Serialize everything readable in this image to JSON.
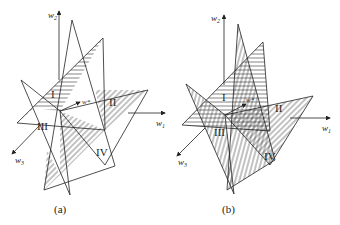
{
  "figure": {
    "panels": [
      {
        "id": "a",
        "caption": "(a)",
        "axes": {
          "x": "w",
          "x_sub": "1",
          "y": "w",
          "y_sub": "2",
          "z": "w",
          "z_sub": "3"
        },
        "vector_label": "w*",
        "regions": [
          "I",
          "II",
          "III",
          "IV"
        ]
      },
      {
        "id": "b",
        "caption": "(b)",
        "axes": {
          "x": "w",
          "x_sub": "1",
          "y": "w",
          "y_sub": "2",
          "z": "w",
          "z_sub": "3"
        },
        "vector_label": "w*",
        "regions": [
          "I",
          "II",
          "III",
          "IV"
        ]
      }
    ],
    "colors": {
      "line": "#222222",
      "background": "#ffffff"
    }
  }
}
